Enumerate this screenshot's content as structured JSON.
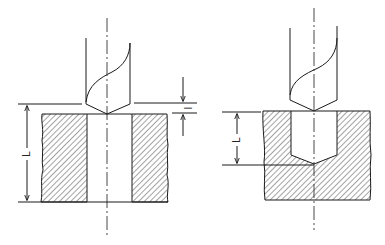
{
  "diagram": {
    "colors": {
      "line": "#1a1a1a",
      "hatch": "#333333",
      "background": "#ffffff"
    },
    "left_figure": {
      "name": "through-hole",
      "dimension_total_label": "L",
      "dimension_lead_label": "l"
    },
    "right_figure": {
      "name": "blind-hole",
      "dimension_depth_label": "L"
    }
  }
}
